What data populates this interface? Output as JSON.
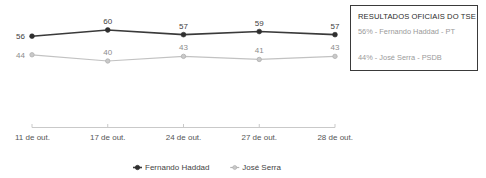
{
  "chart_data": {
    "type": "line",
    "title": "",
    "xlabel": "",
    "ylabel": "",
    "grid": false,
    "legend_position": "bottom",
    "categories": [
      "11 de out.",
      "17 de out.",
      "24 de out.",
      "27 de out.",
      "28 de out."
    ],
    "ylim": [
      0,
      70
    ],
    "series": [
      {
        "name": "Fernando Haddad",
        "color": "#3a3a3a",
        "values": [
          56,
          60,
          57,
          59,
          57
        ],
        "point_labels": [
          "56",
          "60",
          "57",
          "59",
          "57"
        ]
      },
      {
        "name": "José Serra",
        "color": "#b4b4b4",
        "values": [
          44,
          40,
          43,
          41,
          43
        ],
        "point_labels": [
          "44",
          "40",
          "43",
          "41",
          "43"
        ]
      }
    ]
  },
  "annotation": {
    "title": "RESULTADOS OFICIAIS DO  TSE",
    "row1": "56% - Fernando Haddad - PT",
    "row2": "44% - José Serra - PSDB"
  },
  "legend": {
    "items": [
      {
        "label": "Fernando Haddad",
        "color": "#3a3a3a"
      },
      {
        "label": "José Serra",
        "color": "#b4b4b4"
      }
    ]
  },
  "axis": {
    "line_color": "#c9c9c9",
    "ticks": [
      "11 de out.",
      "17 de out.",
      "24 de out.",
      "27 de out.",
      "28 de out."
    ]
  }
}
